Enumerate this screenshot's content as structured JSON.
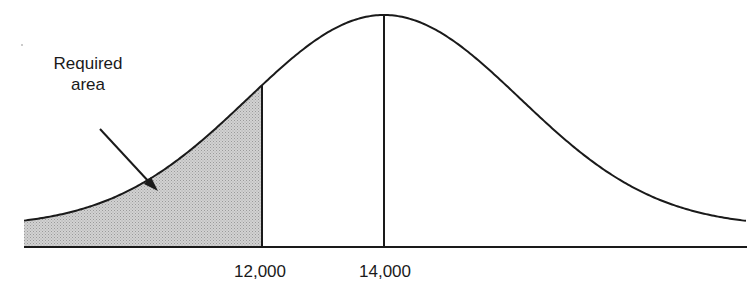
{
  "annotation": {
    "line1": "Required",
    "line2": "area"
  },
  "axis": {
    "ticks": [
      {
        "label": "12,000",
        "value": 12000
      },
      {
        "label": "14,000",
        "value": 14000
      }
    ]
  },
  "colors": {
    "stroke": "#1a1a1a",
    "shade": "#c4c4c4",
    "background": "#ffffff"
  },
  "chart_data": {
    "type": "area",
    "title": "",
    "mean": 14000,
    "cutoff": 12000,
    "shaded_region": "x < 12,000",
    "annotation": "Required area",
    "xlabel": "",
    "ylabel": "",
    "x_tick_labels": [
      "12,000",
      "14,000"
    ],
    "grid": false,
    "legend": "none"
  }
}
